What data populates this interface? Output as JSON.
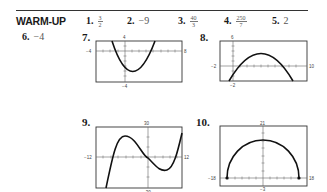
{
  "section": {
    "title": "WARM-UP"
  },
  "answers": [
    {
      "number": "1.",
      "type": "fraction",
      "numerator": "3",
      "denominator": "2"
    },
    {
      "number": "2.",
      "type": "text",
      "value": "−9"
    },
    {
      "number": "3.",
      "type": "fraction",
      "numerator": "40",
      "denominator": "3"
    },
    {
      "number": "4.",
      "type": "fraction",
      "numerator": "250",
      "denominator": "7"
    },
    {
      "number": "5.",
      "type": "text",
      "value": "2"
    },
    {
      "number": "6.",
      "type": "text",
      "value": "−4"
    }
  ],
  "graphs": [
    {
      "number": "7.",
      "shape": "upward parabola",
      "window": {
        "xmin": "−4",
        "xmax": "8",
        "ymin": "−4",
        "ymax": "4"
      }
    },
    {
      "number": "8.",
      "shape": "downward parabola",
      "window": {
        "xmin": "−2",
        "xmax": "10",
        "ymin": "−2",
        "ymax": "6"
      }
    },
    {
      "number": "9.",
      "shape": "cubic",
      "window": {
        "xmin": "−12",
        "xmax": "12",
        "ymin": "−30",
        "ymax": "30"
      }
    },
    {
      "number": "10.",
      "shape": "upper semicircle with endpoints",
      "window": {
        "xmin": "−18",
        "xmax": "18",
        "ymin": "−3",
        "ymax": "21"
      }
    }
  ]
}
